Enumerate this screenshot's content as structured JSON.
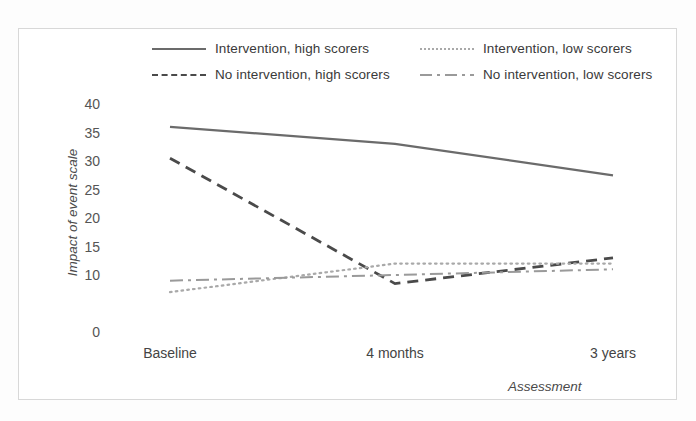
{
  "figure": {
    "border_color": "#d8d8d8",
    "background": "#ffffff"
  },
  "chart_data": {
    "type": "line",
    "title": "",
    "xlabel": "Assessment",
    "ylabel": "Impact of event scale",
    "categories": [
      "Baseline",
      "4 months",
      "3 years"
    ],
    "x_tick_labels": [
      "Baseline",
      "4 months",
      "3 years"
    ],
    "y_tick_labels": [
      "40",
      "35",
      "30",
      "25",
      "20",
      "15",
      "10",
      "",
      "0"
    ],
    "y_tick_values": [
      40,
      35,
      30,
      25,
      20,
      15,
      10,
      5,
      0
    ],
    "ylim": [
      0,
      42
    ],
    "grid": false,
    "legend_position": "top",
    "series": [
      {
        "name": "Intervention, high scorers",
        "style": "solid",
        "color": "#6b6b6b",
        "values": [
          36,
          33,
          27.5
        ]
      },
      {
        "name": "No intervention, high scorers",
        "style": "dashed",
        "color": "#4a4a4a",
        "values": [
          30.5,
          8.5,
          13
        ]
      },
      {
        "name": "Intervention, low scorers",
        "style": "dotted",
        "color": "#a9a9a9",
        "values": [
          7,
          12,
          12
        ]
      },
      {
        "name": "No intervention, low scorers",
        "style": "dash-dot",
        "color": "#9a9a9a",
        "values": [
          9,
          10,
          11
        ]
      }
    ]
  },
  "legend": {
    "items": [
      {
        "label": "Intervention, high scorers",
        "style": "solid"
      },
      {
        "label": "Intervention, low scorers",
        "style": "dotted"
      },
      {
        "label": "No intervention, high scorers",
        "style": "dashed"
      },
      {
        "label": "No intervention, low scorers",
        "style": "dash-dot"
      }
    ]
  }
}
